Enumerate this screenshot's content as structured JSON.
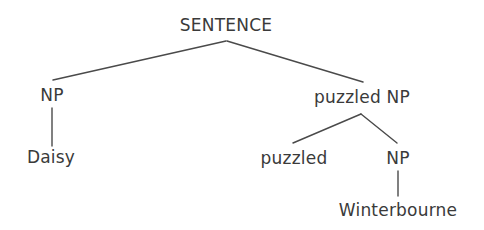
{
  "diagram": {
    "type": "syntax-tree",
    "nodes": {
      "root": {
        "label": "SENTENCE"
      },
      "np_left": {
        "label": "NP"
      },
      "daisy": {
        "label": "Daisy"
      },
      "puzzled_np": {
        "label": "puzzled NP"
      },
      "puzzled": {
        "label": "puzzled"
      },
      "np_right": {
        "label": "NP"
      },
      "winterbourne": {
        "label": "Winterbourne"
      }
    },
    "edges": [
      {
        "from": "root",
        "to": "np_left"
      },
      {
        "from": "root",
        "to": "puzzled_np"
      },
      {
        "from": "np_left",
        "to": "daisy"
      },
      {
        "from": "puzzled_np",
        "to": "puzzled"
      },
      {
        "from": "puzzled_np",
        "to": "np_right"
      },
      {
        "from": "np_right",
        "to": "winterbourne"
      }
    ],
    "colors": {
      "text": "#3a3a3a",
      "line": "#4a4a4a",
      "background": "#ffffff"
    }
  }
}
